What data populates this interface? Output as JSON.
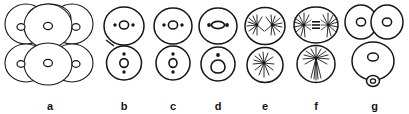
{
  "figure": {
    "kind": "line-drawing-biology-diagram",
    "background_color": "#ffffff",
    "ink_color": "#151515",
    "width": 409,
    "height": 114,
    "panel_count": 7
  },
  "panels": [
    {
      "label": "a",
      "name": "panel-a",
      "description": "Cluster of large overlapping spherical cells, each with a small round nucleus; arranged as two rows of three overlapping spheres",
      "cells": 6,
      "nuclei": 6,
      "left": 2,
      "width": 96
    },
    {
      "label": "b",
      "name": "panel-b",
      "description": "Two stacked cells; upper cell has a round nucleus flanked by two lateral dots, lower cell has a round nucleus with dots above and below",
      "cells": 2,
      "nuclei": 2,
      "left": 98,
      "width": 52
    },
    {
      "label": "c",
      "name": "panel-c",
      "description": "Two stacked cells; upper cell has a round nucleus with two lateral dots, lower cell has a round nucleus with a dot above and below",
      "cells": 2,
      "nuclei": 2,
      "left": 150,
      "width": 46
    },
    {
      "label": "d",
      "name": "panel-d",
      "description": "Two stacked cells; upper cell has an elongated horizontal nucleus with lateral dots, lower cell has a flask-shaped nucleus with a dot above",
      "cells": 2,
      "nuclei": 2,
      "left": 196,
      "width": 44
    },
    {
      "label": "e",
      "name": "panel-e",
      "description": "Two stacked cells each containing radiating aster or starburst spindle structures",
      "cells": 2,
      "asters": 3,
      "left": 240,
      "width": 50
    },
    {
      "label": "f",
      "name": "panel-f",
      "description": "Two stacked cells; upper cell shows a bipolar spindle with two asters and a dark metaphase plate between them, lower cell shows a single aster with descending fibers",
      "cells": 2,
      "asters": 3,
      "left": 290,
      "width": 52
    },
    {
      "label": "g",
      "name": "panel-g",
      "description": "Two side-by-side daughter cells with nuclei on top, a larger cell with a nucleus below, and a tiny polar body attached at the bottom",
      "cells": 4,
      "nuclei": 4,
      "left": 342,
      "width": 65
    }
  ]
}
